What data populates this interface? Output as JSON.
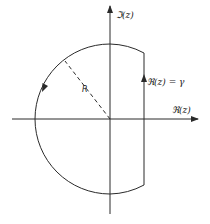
{
  "diagram": {
    "type": "contour-plot",
    "axes": {
      "horizontal_label": "ℜ(z)",
      "vertical_label": "ℑ(z)"
    },
    "labels": {
      "radius": "R",
      "line": "ℜ(z) = γ"
    },
    "contour": {
      "arc_direction": "counterclockwise",
      "line_direction": "upward"
    },
    "colors": {
      "stroke": "#2a2a2a",
      "background": "#ffffff"
    }
  }
}
